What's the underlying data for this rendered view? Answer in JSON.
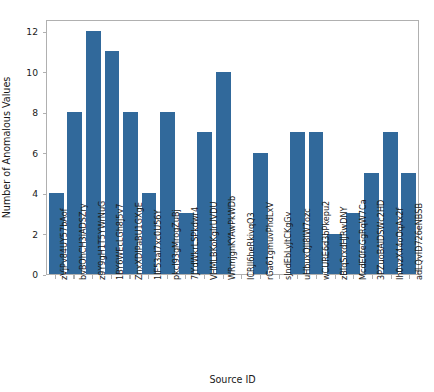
{
  "chart_data": {
    "type": "bar",
    "title": "",
    "xlabel": "Source ID",
    "ylabel": "Number of Anomalous Values",
    "ylim": [
      0,
      12.6
    ],
    "yticks": [
      0,
      2,
      4,
      6,
      8,
      10,
      12
    ],
    "grid": false,
    "legend": null,
    "bar_color": "#31699b",
    "categories": [
      "zVjPv84UY57bAof",
      "bvBOhCH3iADSZry",
      "z9Y9gH1T5YWrNuG",
      "1BY6WEcLGh8j5v7",
      "ZnxXDIPaBU1GXgE",
      "1IF53aI7xc0U56Y",
      "pkcI93gMrogZuBj",
      "7JYdWkrLSPkdwr4",
      "VHMLBKoKgIrUVDU",
      "WRmjgnKYAwPkWDb",
      "ICRJl6heRkivqQ3",
      "rGa61gmuvPhdLxV",
      "sJndEbLyJtCKgGv",
      "uHbuxQJl8IW7ozc",
      "wCURE6d3bPkepu2",
      "zBIqSrxdHJRwDNY",
      "McdE0feGgRqW7Ca",
      "3PZuoBAlDSWc2HD",
      "Ih0vzX44oOqAx2f",
      "adLQvID726eNBSB"
    ],
    "values": [
      4,
      8,
      12,
      11,
      8,
      4,
      8,
      3,
      7,
      10,
      0,
      6,
      0,
      7,
      7,
      2,
      3,
      5,
      7,
      5
    ]
  }
}
